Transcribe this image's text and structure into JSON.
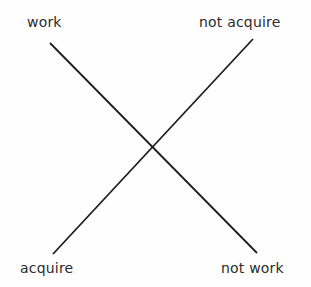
{
  "diagram": {
    "type": "cross-diagram",
    "labels": {
      "top_left": "work",
      "top_right": "not acquire",
      "bottom_left": "acquire",
      "bottom_right": "not work"
    },
    "lines": [
      {
        "name": "work-to-not-work",
        "from": [
          50,
          43
        ],
        "to": [
          257,
          253
        ]
      },
      {
        "name": "acquire-to-not-acquire",
        "from": [
          53,
          254
        ],
        "to": [
          253,
          39
        ]
      }
    ],
    "colors": {
      "line": "#1e1e1e",
      "text": "#2b2b2b",
      "background": "#fefefe"
    }
  }
}
